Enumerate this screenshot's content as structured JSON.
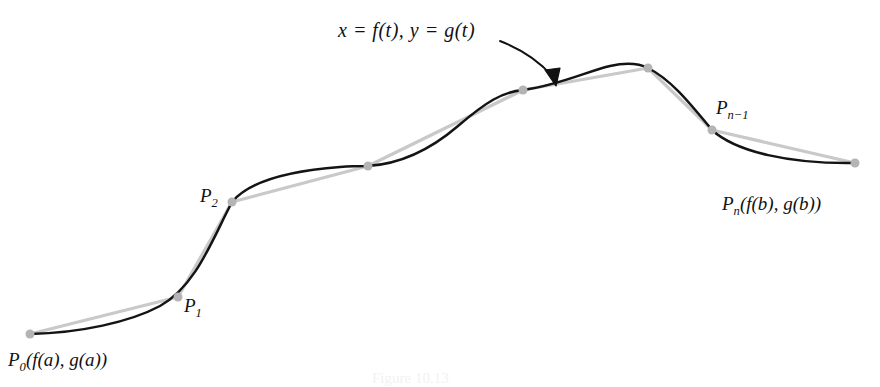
{
  "figure": {
    "title_label": "x = f(t), y = g(t)",
    "caption": "Figure 10.13",
    "colors": {
      "curve": "#141414",
      "polyline": "#c9c9c9",
      "node": "#b4b4b4",
      "arrow": "#111111",
      "background": "#ffffff"
    }
  },
  "labels": {
    "p0": {
      "base": "P",
      "sub": "0",
      "args": "(f(a), g(a))"
    },
    "p1": {
      "base": "P",
      "sub": "1",
      "args": ""
    },
    "p2": {
      "base": "P",
      "sub": "2",
      "args": ""
    },
    "pn_minus_1": {
      "base": "P",
      "sub": "n−1",
      "args": ""
    },
    "pn": {
      "base": "P",
      "sub": "n",
      "args": "(f(b), g(b))"
    }
  },
  "chart_data": {
    "type": "line",
    "title": "x = f(t), y = g(t)",
    "xlabel": "",
    "ylabel": "",
    "grid": false,
    "legend": "none",
    "nodes": [
      {
        "name": "P0",
        "x": 30,
        "y": 334,
        "labeled": true
      },
      {
        "name": "P1",
        "x": 178,
        "y": 297,
        "labeled": true
      },
      {
        "name": "P2",
        "x": 232,
        "y": 202,
        "labeled": true
      },
      {
        "name": "P3",
        "x": 368,
        "y": 166,
        "labeled": false
      },
      {
        "name": "P4",
        "x": 523,
        "y": 90,
        "labeled": false
      },
      {
        "name": "P5",
        "x": 648,
        "y": 68,
        "labeled": false
      },
      {
        "name": "Pn-1",
        "x": 712,
        "y": 130,
        "labeled": true
      },
      {
        "name": "Pn",
        "x": 855,
        "y": 163,
        "labeled": true
      }
    ],
    "curve_path": "M 30 334 C 80 333, 130 322, 160 306 C 196 286, 212 240, 232 202 C 252 178, 300 170, 340 167 C 352 166, 362 166, 368 166 C 400 164, 430 150, 458 126 C 486 102, 502 92, 523 90 C 560 85, 585 72, 610 66 C 628 62, 640 64, 648 68 C 672 80, 692 106, 712 130 C 736 152, 790 164, 855 163",
    "polyline_path": "M 30 334 L 178 297 L 232 202 L 368 166 L 523 90 L 648 68 L 712 130 L 855 163",
    "annotation_arrow": {
      "label": "x = f(t), y = g(t)",
      "from_x": 500,
      "from_y": 40,
      "to_x": 557,
      "to_y": 84
    }
  }
}
